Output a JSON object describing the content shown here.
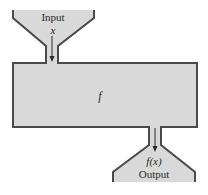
{
  "diagram": {
    "type": "function-machine",
    "input": {
      "label": "Input",
      "variable": "x"
    },
    "machine": {
      "label": "f"
    },
    "output": {
      "label": "Output",
      "expression": "f(x)"
    },
    "colors": {
      "fill": "#d9d9d9",
      "stroke": "#4a4a4a",
      "text": "#2a2a2a",
      "background": "#ffffff"
    }
  }
}
